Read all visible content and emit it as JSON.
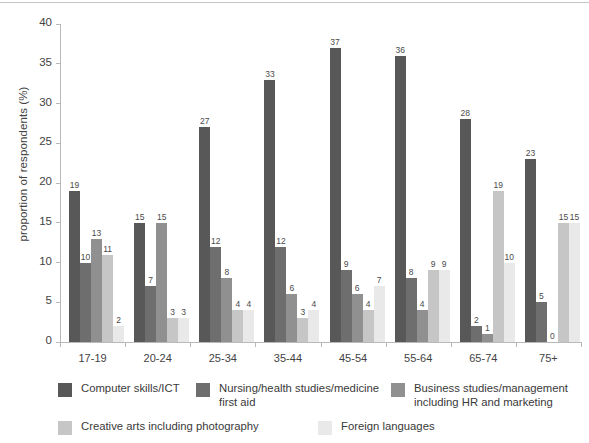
{
  "chart_data": {
    "type": "bar",
    "title": "",
    "xlabel": "",
    "ylabel": "proportion of respondents (%)",
    "ylim": [
      0,
      40
    ],
    "yticks": [
      0,
      5,
      10,
      15,
      20,
      25,
      30,
      35,
      40
    ],
    "grid": false,
    "legend_position": "bottom",
    "categories": [
      "17-19",
      "20-24",
      "25-34",
      "35-44",
      "45-54",
      "55-64",
      "65-74",
      "75+"
    ],
    "series": [
      {
        "name": "Computer skills/ICT",
        "color": "#585858",
        "values": [
          19,
          15,
          27,
          33,
          37,
          36,
          28,
          23
        ]
      },
      {
        "name": "Nursing/health studies/medicine\nfirst aid",
        "color": "#6e6e6e",
        "values": [
          10,
          7,
          12,
          12,
          9,
          8,
          2,
          5
        ]
      },
      {
        "name": "Business studies/management\nincluding HR and marketing",
        "color": "#909090",
        "values": [
          13,
          15,
          8,
          6,
          6,
          4,
          1,
          0
        ]
      },
      {
        "name": "Creative arts including photography",
        "color": "#c6c6c6",
        "values": [
          11,
          3,
          4,
          3,
          4,
          9,
          19,
          15
        ]
      },
      {
        "name": "Foreign languages",
        "color": "#e9e9e9",
        "values": [
          2,
          3,
          4,
          4,
          7,
          9,
          10,
          15
        ]
      }
    ]
  },
  "legend": [
    {
      "label": "Computer skills/ICT",
      "color": "#585858"
    },
    {
      "label": "Nursing/health studies/medicine\nfirst aid",
      "color": "#6e6e6e"
    },
    {
      "label": "Business studies/management\nincluding HR and marketing",
      "color": "#909090"
    },
    {
      "label": "Creative arts including photography",
      "color": "#c6c6c6"
    },
    {
      "label": "Foreign languages",
      "color": "#e9e9e9"
    }
  ]
}
